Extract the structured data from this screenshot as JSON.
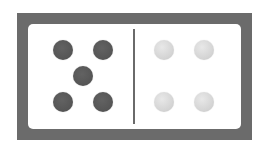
{
  "domino": {
    "left_half": {
      "value": 5,
      "pip_color": "#575757",
      "pips": [
        {
          "x": 35,
          "y": 26
        },
        {
          "x": 75,
          "y": 26
        },
        {
          "x": 55,
          "y": 52
        },
        {
          "x": 35,
          "y": 78
        },
        {
          "x": 75,
          "y": 78
        }
      ]
    },
    "right_half": {
      "value": 4,
      "pip_color": "#d6d6d6",
      "pips": [
        {
          "x": 136,
          "y": 26
        },
        {
          "x": 176,
          "y": 26
        },
        {
          "x": 136,
          "y": 78
        },
        {
          "x": 176,
          "y": 78
        }
      ]
    },
    "colors": {
      "frame": "#6b6b6b",
      "face": "#ffffff",
      "divider": "#6a6a6a"
    }
  }
}
